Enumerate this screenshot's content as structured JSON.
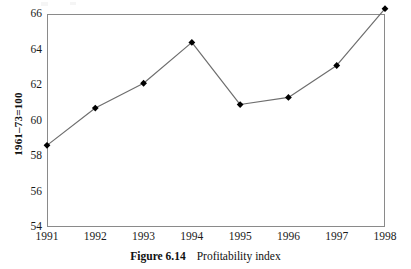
{
  "chart_data": {
    "type": "line",
    "title": "Profitability index",
    "xlabel": "",
    "ylabel": "1961–73=100",
    "categories": [
      "1991",
      "1992",
      "1993",
      "1994",
      "1995",
      "1996",
      "1997",
      "1998"
    ],
    "values": [
      58.6,
      60.7,
      62.1,
      64.4,
      60.9,
      61.3,
      63.1,
      66.3
    ],
    "series": [
      {
        "name": "Profitability index",
        "values": [
          58.6,
          60.7,
          62.1,
          64.4,
          60.9,
          61.3,
          63.1,
          66.3
        ]
      }
    ],
    "ylim": [
      54,
      66
    ],
    "y_ticks": [
      54,
      56,
      58,
      60,
      62,
      64,
      66
    ],
    "y_tick_labels": [
      "54",
      "56",
      "58",
      "60",
      "62",
      "64",
      "66"
    ],
    "x_tick_labels": [
      "1991",
      "1992",
      "1993",
      "1994",
      "1995",
      "1996",
      "1997",
      "1998"
    ],
    "grid": false,
    "legend": "none",
    "marker": "diamond",
    "marker_color": "#000000",
    "line_color": "#6e6e6e",
    "axis_color": "#8a8a8a",
    "background_color": "#ffffff"
  },
  "caption": {
    "number": "Figure 6.14",
    "title": "Profitability index"
  }
}
